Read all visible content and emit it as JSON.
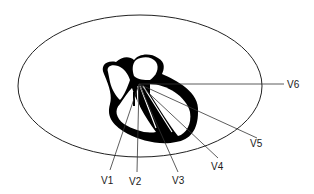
{
  "diagram": {
    "chest_outline": {
      "shape": "ellipse",
      "cx": 140,
      "cy": 86,
      "rx": 122,
      "ry": 71,
      "color": "#222222"
    },
    "origin": {
      "x": 139,
      "y": 84
    },
    "leads": [
      {
        "label": "V1",
        "end": [
          110,
          170
        ],
        "label_pos": [
          101,
          184
        ]
      },
      {
        "label": "V2",
        "end": [
          137,
          172
        ],
        "label_pos": [
          129,
          185
        ]
      },
      {
        "label": "V3",
        "end": [
          178,
          172
        ],
        "label_pos": [
          172,
          184
        ]
      },
      {
        "label": "V4",
        "end": [
          218,
          158
        ],
        "label_pos": [
          211,
          170
        ]
      },
      {
        "label": "V5",
        "end": [
          257,
          128
        ],
        "label_pos": [
          250,
          145
        ]
      },
      {
        "label": "V6",
        "end": [
          284,
          84
        ],
        "label_pos": [
          287,
          88
        ]
      }
    ],
    "heart_fill": "#000000",
    "line_color": "#333333"
  }
}
